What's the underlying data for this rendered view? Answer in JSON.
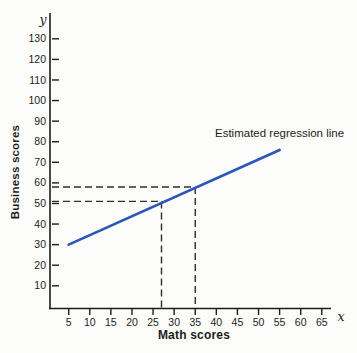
{
  "chart_data": {
    "type": "line",
    "title": "",
    "xlabel": "Math scores",
    "ylabel": "Business scores",
    "x_axis_letter": "x",
    "y_axis_letter": "y",
    "xticks": [
      5,
      10,
      15,
      20,
      25,
      30,
      35,
      40,
      45,
      50,
      55,
      60,
      65
    ],
    "yticks": [
      10,
      20,
      30,
      40,
      50,
      60,
      70,
      80,
      90,
      100,
      110,
      120,
      130
    ],
    "xlim": [
      0,
      68
    ],
    "ylim": [
      0,
      140
    ],
    "grid": false,
    "legend": "none",
    "series": [
      {
        "name": "Estimated regression line",
        "type": "line",
        "color": "#2b57b8",
        "points": [
          [
            5,
            30
          ],
          [
            55,
            76
          ]
        ]
      }
    ],
    "guides": [
      {
        "x": 27,
        "y": 51
      },
      {
        "x": 35,
        "y": 58
      }
    ],
    "annotation": {
      "text": "Estimated regression line"
    },
    "colors": {
      "axis": "#1c1c1c",
      "dash": "#2e2e2e",
      "line": "#2b57b8",
      "background": "#fcfcfa",
      "text": "#1c1c1c"
    }
  }
}
